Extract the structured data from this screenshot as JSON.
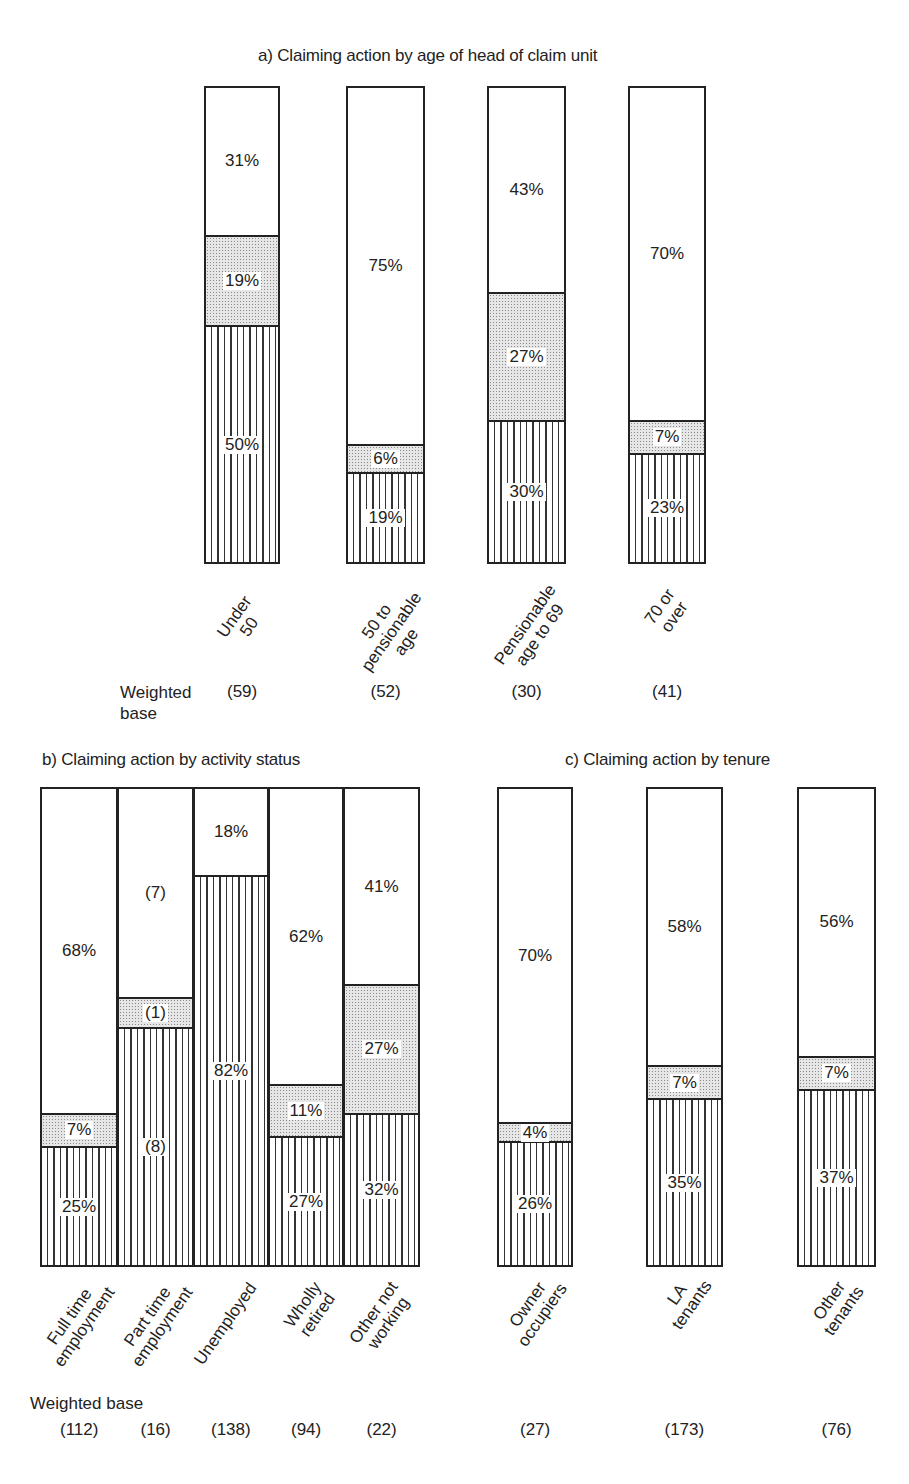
{
  "chart_data": [
    {
      "type": "bar",
      "stacked": true,
      "percent": true,
      "title": "a) Claiming action by age of head of claim unit",
      "categories": [
        "Under 50",
        "50 to pensionable age",
        "Pensionable age to 69",
        "70 or over"
      ],
      "category_labels": [
        "Under\n50",
        "50 to\npensionable\nage",
        "Pensionable\nage to 69",
        "70 or\nover"
      ],
      "series": [
        {
          "name": "hatched (bottom)",
          "pattern": "vertical-lines",
          "values": [
            50,
            19,
            30,
            23
          ],
          "labels": [
            "50%",
            "19%",
            "30%",
            "23%"
          ]
        },
        {
          "name": "dotted (middle)",
          "pattern": "dotted",
          "values": [
            19,
            6,
            27,
            7
          ],
          "labels": [
            "19%",
            "6%",
            "27%",
            "7%"
          ]
        },
        {
          "name": "white (top)",
          "pattern": "none",
          "values": [
            31,
            75,
            43,
            70
          ],
          "labels": [
            "31%",
            "75%",
            "43%",
            "70%"
          ]
        }
      ],
      "weighted_base_label": "Weighted\nbase",
      "weighted_base": [
        "(59)",
        "(52)",
        "(30)",
        "(41)"
      ],
      "ylim": [
        0,
        100
      ]
    },
    {
      "type": "bar",
      "stacked": true,
      "percent": true,
      "title": "b) Claiming action by activity status",
      "categories": [
        "Full time employment",
        "Part time employment",
        "Unemployed",
        "Wholly retired",
        "Other not working"
      ],
      "category_labels": [
        "Full time\nemployment",
        "Part time\nemployment",
        "Unemployed",
        "Wholly\nretired",
        "Other not\nworking"
      ],
      "series": [
        {
          "name": "hatched (bottom)",
          "pattern": "vertical-lines",
          "values": [
            25,
            50,
            82,
            27,
            32
          ],
          "labels": [
            "25%",
            "(8)",
            "82%",
            "27%",
            "32%"
          ]
        },
        {
          "name": "dotted (middle)",
          "pattern": "dotted",
          "values": [
            7,
            6.25,
            0,
            11,
            27
          ],
          "labels": [
            "7%",
            "(1)",
            "",
            "11%",
            "27%"
          ]
        },
        {
          "name": "white (top)",
          "pattern": "none",
          "values": [
            68,
            43.75,
            18,
            62,
            41
          ],
          "labels": [
            "68%",
            "(7)",
            "18%",
            "62%",
            "41%"
          ]
        }
      ],
      "weighted_base_label": "Weighted base",
      "weighted_base": [
        "(112)",
        "(16)",
        "(138)",
        "(94)",
        "(22)"
      ],
      "ylim": [
        0,
        100
      ]
    },
    {
      "type": "bar",
      "stacked": true,
      "percent": true,
      "title": "c) Claiming action by tenure",
      "categories": [
        "Owner occupiers",
        "LA tenants",
        "Other tenants"
      ],
      "category_labels": [
        "Owner\noccupiers",
        "LA\ntenants",
        "Other\ntenants"
      ],
      "series": [
        {
          "name": "hatched (bottom)",
          "pattern": "vertical-lines",
          "values": [
            26,
            35,
            37
          ],
          "labels": [
            "26%",
            "35%",
            "37%"
          ]
        },
        {
          "name": "dotted (middle)",
          "pattern": "dotted",
          "values": [
            4,
            7,
            7
          ],
          "labels": [
            "4%",
            "7%",
            "7%"
          ]
        },
        {
          "name": "white (top)",
          "pattern": "none",
          "values": [
            70,
            58,
            56
          ],
          "labels": [
            "70%",
            "58%",
            "56%"
          ]
        }
      ],
      "weighted_base": [
        "(27)",
        "(173)",
        "(76)"
      ],
      "ylim": [
        0,
        100
      ]
    }
  ]
}
